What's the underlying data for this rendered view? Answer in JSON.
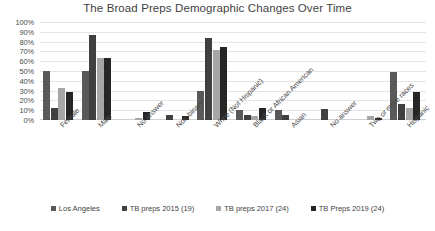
{
  "chart_data": {
    "type": "bar",
    "title": "The Broad Preps Demographic Changes Over Time",
    "xlabel": "",
    "ylabel": "",
    "ylim": [
      0,
      100
    ],
    "ytick_labels": [
      "100%",
      "90%",
      "80%",
      "70%",
      "60%",
      "50%",
      "40%",
      "30%",
      "20%",
      "10%",
      "0%"
    ],
    "ytick_values": [
      100,
      90,
      80,
      70,
      60,
      50,
      40,
      30,
      20,
      10,
      0
    ],
    "grid": true,
    "legend_position": "bottom",
    "categories": [
      "Female",
      "Male",
      "No answer",
      "Non-binary",
      "White (Not Hispanic)",
      "Black or African American",
      "Asian",
      "No answer",
      "Two or more races",
      "Hispanic"
    ],
    "series": [
      {
        "name": "Los Angeles",
        "color": "#595959",
        "values": [
          50,
          50,
          0,
          0,
          30,
          10,
          10,
          0,
          0,
          49
        ]
      },
      {
        "name": "TB preps 2015 (19)",
        "color": "#404040",
        "values": [
          12,
          87,
          0,
          5,
          84,
          5,
          5,
          11,
          0,
          16
        ]
      },
      {
        "name": "TB preps 2017 (24)",
        "color": "#a6a6a6",
        "values": [
          33,
          63,
          2,
          0,
          71,
          4,
          0,
          0,
          4,
          12
        ]
      },
      {
        "name": "TB Preps 2019 (24)",
        "color": "#262626",
        "values": [
          29,
          63,
          8,
          4,
          75,
          12,
          0,
          0,
          2,
          29
        ]
      }
    ]
  },
  "legend": {
    "items": [
      {
        "label": "Los Angeles",
        "color": "#595959"
      },
      {
        "label": "TB preps 2015 (19)",
        "color": "#404040"
      },
      {
        "label": "TB preps 2017 (24)",
        "color": "#a6a6a6"
      },
      {
        "label": "TB Preps 2019 (24)",
        "color": "#262626"
      }
    ]
  }
}
